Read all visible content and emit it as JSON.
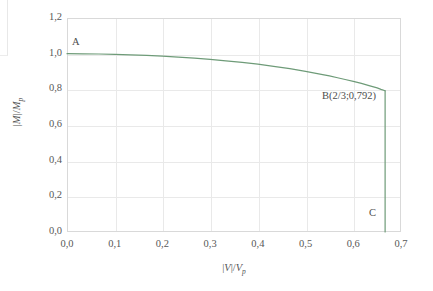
{
  "chart_data": {
    "type": "line",
    "title": "",
    "subtitle": "",
    "xlabel": "|V|/V_p",
    "ylabel": "|M|/M_p",
    "xlim": [
      0.0,
      0.7
    ],
    "ylim": [
      0.0,
      1.2
    ],
    "grid": true,
    "legend": null,
    "legend_position": "none",
    "x_tick_labels": [
      "0,0",
      "0,1",
      "0,2",
      "0,3",
      "0,4",
      "0,5",
      "0,6",
      "0,7"
    ],
    "x_tick_values": [
      0.0,
      0.1,
      0.2,
      0.3,
      0.4,
      0.5,
      0.6,
      0.7
    ],
    "y_tick_labels": [
      "0,0",
      "0,2",
      "0,4",
      "0,6",
      "0,8",
      "1,0",
      "1,2"
    ],
    "y_tick_values": [
      0.0,
      0.2,
      0.4,
      0.6,
      0.8,
      1.0,
      1.2
    ],
    "series": [
      {
        "name": "M-V interaction envelope",
        "color": "#6e9b78",
        "x": [
          0.0,
          0.033,
          0.067,
          0.1,
          0.133,
          0.167,
          0.2,
          0.233,
          0.267,
          0.3,
          0.333,
          0.367,
          0.4,
          0.433,
          0.467,
          0.5,
          0.533,
          0.55,
          0.567,
          0.583,
          0.6,
          0.617,
          0.633,
          0.65,
          0.658,
          0.6667
        ],
        "y": [
          1.0,
          0.999,
          0.998,
          0.996,
          0.993,
          0.99,
          0.986,
          0.981,
          0.975,
          0.968,
          0.96,
          0.951,
          0.941,
          0.929,
          0.916,
          0.901,
          0.884,
          0.875,
          0.865,
          0.855,
          0.845,
          0.833,
          0.821,
          0.808,
          0.8,
          0.792
        ]
      },
      {
        "name": "shear cut-off vertical drop",
        "color": "#6e9b78",
        "x": [
          0.6667,
          0.6667
        ],
        "y": [
          0.792,
          0.0
        ]
      }
    ],
    "annotations": [
      {
        "label": "A",
        "x": 0.0,
        "y": 1.0
      },
      {
        "label": "B(2/3;0,792)",
        "x": 0.6667,
        "y": 0.792
      },
      {
        "label": "C",
        "x": 0.6667,
        "y": 0.0
      }
    ],
    "colors": {
      "curve": "#6e9b78",
      "grid": "#e9e9e9",
      "frame": "#d9d9d9",
      "tick_text": "#575757",
      "axis_title": "#555555",
      "background": "#ffffff"
    }
  },
  "axis": {
    "y_title_numerator": "M",
    "y_title_denominator": "M",
    "y_title_subscript": "p",
    "x_title_numerator": "V",
    "x_title_denominator": "V",
    "x_title_subscript": "p",
    "abs_bar": "|",
    "slash": "/"
  },
  "ticks": {
    "x": [
      "0,0",
      "0,1",
      "0,2",
      "0,3",
      "0,4",
      "0,5",
      "0,6",
      "0,7"
    ],
    "y_top_to_bottom": [
      "1,2",
      "1,0",
      "0,8",
      "0,6",
      "0,4",
      "0,2",
      "0,0"
    ]
  },
  "annotations": {
    "a": "A",
    "b": "B(2/3;0,792)",
    "c": "C"
  }
}
